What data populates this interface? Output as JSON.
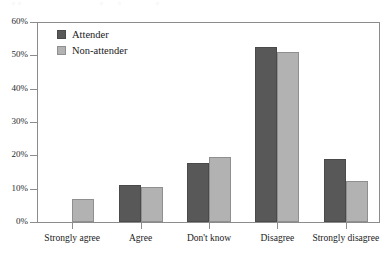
{
  "page_bleed": {
    "a": "▫",
    "b": "▫",
    "c": "▫",
    "d": "▫",
    "e": "▫"
  },
  "legend": {
    "position": "top-left-inside",
    "items": [
      {
        "label": "Attender",
        "color": "#585858",
        "key": "attender"
      },
      {
        "label": "Non-attender",
        "color": "#b2b2b2",
        "key": "nonattender"
      }
    ]
  },
  "axes": {
    "y_ticks": [
      "0%",
      "10%",
      "20%",
      "30%",
      "40%",
      "50%",
      "60%"
    ],
    "y_min": 0,
    "y_max": 60
  },
  "chart_data": {
    "type": "bar",
    "title": "",
    "subtitle": "",
    "xlabel": "",
    "ylabel": "",
    "ylim": [
      0,
      60
    ],
    "ytick_labels": [
      "0%",
      "10%",
      "20%",
      "30%",
      "40%",
      "50%",
      "60%"
    ],
    "ytick_values": [
      0,
      10,
      20,
      30,
      40,
      50,
      60
    ],
    "grid": false,
    "value_unit": "percent",
    "legend_position": "upper left (inside plot area)",
    "categories": [
      "Strongly agree",
      "Agree",
      "Don't know",
      "Disagree",
      "Strongly disagree"
    ],
    "series": [
      {
        "name": "Attender",
        "color": "#585858",
        "values": [
          0,
          11,
          17.7,
          52.5,
          19
        ]
      },
      {
        "name": "Non-attender",
        "color": "#b2b2b2",
        "values": [
          7,
          10.5,
          19.5,
          51,
          12.3
        ]
      }
    ]
  }
}
